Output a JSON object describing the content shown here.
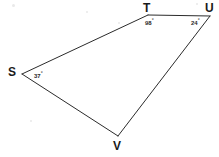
{
  "figure": {
    "background_color": "#ffffff",
    "stroke_color": "#2b2b2b",
    "stroke_width": 1,
    "width": 219,
    "height": 157
  },
  "vertices": [
    {
      "id": "S",
      "label": "S",
      "x": 22,
      "y": 74,
      "label_x": 8,
      "label_y": 66
    },
    {
      "id": "T",
      "label": "T",
      "x": 148,
      "y": 15,
      "label_x": 143,
      "label_y": 2
    },
    {
      "id": "U",
      "label": "U",
      "x": 210,
      "y": 16,
      "label_x": 205,
      "label_y": 2
    },
    {
      "id": "V",
      "label": "V",
      "x": 118,
      "y": 136,
      "label_x": 113,
      "label_y": 140
    }
  ],
  "edges": [
    {
      "id": "ST",
      "from": "S",
      "to": "T"
    },
    {
      "id": "TU",
      "from": "T",
      "to": "U"
    },
    {
      "id": "UV",
      "from": "U",
      "to": "V"
    },
    {
      "id": "VS",
      "from": "V",
      "to": "S"
    }
  ],
  "angles": [
    {
      "id": "angle-S",
      "vertex": "S",
      "value": "37",
      "degree_symbol": "°",
      "x": 34,
      "y": 71
    },
    {
      "id": "angle-T",
      "vertex": "T",
      "value": "98",
      "degree_symbol": "°",
      "x": 145,
      "y": 18
    },
    {
      "id": "angle-U",
      "vertex": "U",
      "value": "24",
      "degree_symbol": "°",
      "x": 191,
      "y": 18
    }
  ],
  "artifacts": [
    {
      "x": 12,
      "y": 4,
      "size": 3
    },
    {
      "x": 86,
      "y": 11,
      "size": 2
    },
    {
      "x": 118,
      "y": 22,
      "size": 2
    },
    {
      "x": 196,
      "y": 3,
      "size": 2
    },
    {
      "x": 30,
      "y": 120,
      "size": 2
    }
  ]
}
